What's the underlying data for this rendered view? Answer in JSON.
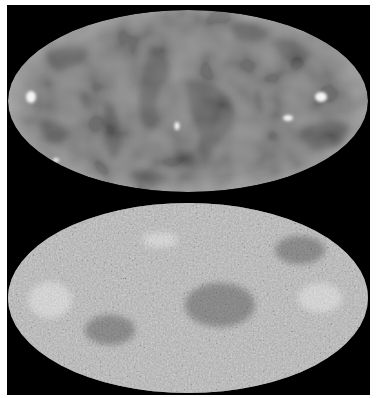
{
  "figure": {
    "background": "#000000",
    "page_background": "#ffffff",
    "panels": [
      {
        "id": "top-map",
        "description": "Low-resolution all-sky map (Mollweide projection), smooth gray blotches",
        "center": [
          188,
          101
        ],
        "radii": [
          180,
          91
        ],
        "base_color": "#8a8a8a",
        "rim_color": "#9a9a9a",
        "dark_color": "#5e5e5e",
        "bright_spots": [
          [
            30,
            97
          ],
          [
            177,
            126
          ],
          [
            288,
            117
          ],
          [
            320,
            97
          ],
          [
            56,
            160
          ]
        ]
      },
      {
        "id": "bottom-map",
        "description": "High-resolution all-sky map (Mollweide projection), fine-grained speckle with white and dark spots",
        "center": [
          188,
          298
        ],
        "radii": [
          180,
          95
        ],
        "base_color": "#7a7a7a",
        "speckle_light": "#f0f0f0",
        "speckle_dark": "#3a3a3a"
      }
    ]
  }
}
